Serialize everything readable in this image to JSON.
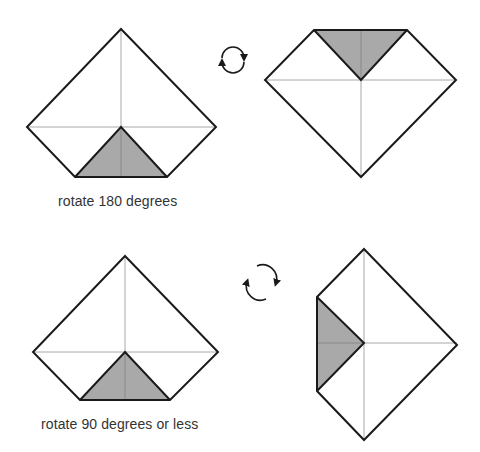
{
  "colors": {
    "background": "#ffffff",
    "outline": "#1a1a1a",
    "crease": "#a8a8a8",
    "shaded_flap": "#a9a9a9",
    "caption": "#333333"
  },
  "steps": [
    {
      "id": "step-rotate-180",
      "caption": "rotate 180 degrees",
      "rotation_icon": "circular-arrows-clockwise-icon",
      "before": "square-with-bottom-corner-folded-up",
      "after": "square-with-top-corner-folded-down"
    },
    {
      "id": "step-rotate-90",
      "caption": "rotate 90 degrees or less",
      "rotation_icon": "rotate-arrows-icon",
      "before": "square-with-bottom-corner-folded-up",
      "after": "square-with-left-corner-folded-in"
    }
  ]
}
